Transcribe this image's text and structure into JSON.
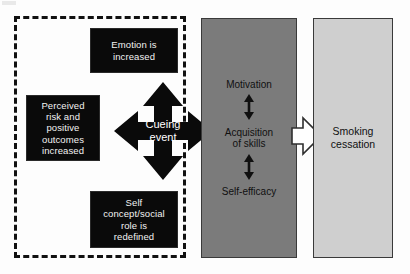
{
  "diagram": {
    "dashed_group": {
      "name": "cognitive-affective-group",
      "boxes": [
        {
          "id": "emotion",
          "label": "Emotion is\nincreased"
        },
        {
          "id": "perceived",
          "label": "Perceived\nrisk and\npositive\noutcomes\nincreased"
        },
        {
          "id": "self",
          "label": "Self\nconcept/social\nrole is\nredefined"
        }
      ]
    },
    "center": {
      "label": "Cueing\nevent",
      "arrow_icon": "four-way-arrow-icon",
      "directions": [
        "up",
        "down",
        "left",
        "right"
      ]
    },
    "process_box": {
      "fill": "#7b7b7b",
      "items": [
        {
          "label": "Motivation"
        },
        {
          "label": "Acquisition\nof skills"
        },
        {
          "label": "Self-efficacy"
        }
      ],
      "connectors": [
        "double-headed-vertical-arrow-icon",
        "double-headed-vertical-arrow-icon"
      ],
      "connector_glyph": "↕"
    },
    "outcome_box": {
      "fill": "#cfcfcf",
      "label": "Smoking\ncessation"
    },
    "flow_arrow": {
      "icon": "right-block-arrow-icon",
      "direction": "right",
      "fill": "#ffffff"
    },
    "colors": {
      "black_box": "#0a0a0a",
      "black_box_text": "#f2f2f2",
      "process_gray": "#7b7b7b",
      "outcome_gray": "#cfcfcf",
      "outline": "#3a3a3a",
      "dashed_border": "#111111",
      "background": "#fdfdfd"
    }
  }
}
